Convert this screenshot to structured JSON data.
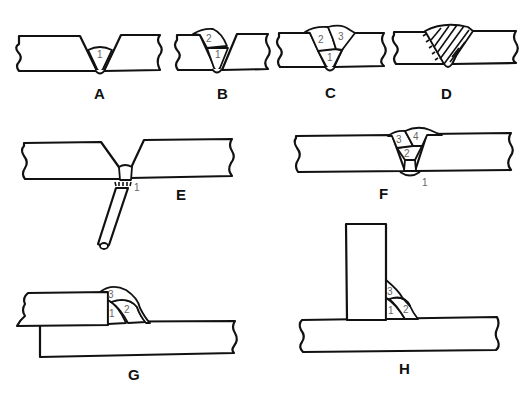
{
  "diagram": {
    "colors": {
      "line": "#111111",
      "pass_number": "#666666",
      "background": "#ffffff"
    },
    "figures": [
      {
        "id": "A",
        "label": "A",
        "joint": "single-V butt",
        "passes": [
          "1"
        ]
      },
      {
        "id": "B",
        "label": "B",
        "joint": "single-V butt",
        "passes": [
          "1",
          "2"
        ]
      },
      {
        "id": "C",
        "label": "C",
        "joint": "single-V butt",
        "passes": [
          "1",
          "2",
          "3"
        ]
      },
      {
        "id": "D",
        "label": "D",
        "joint": "single-V butt (hatched fill)",
        "passes": []
      },
      {
        "id": "E",
        "label": "E",
        "joint": "single-V butt with electrode (root pass)",
        "passes": [
          "1"
        ]
      },
      {
        "id": "F",
        "label": "F",
        "joint": "single-V butt",
        "passes": [
          "1",
          "2",
          "3",
          "4"
        ]
      },
      {
        "id": "G",
        "label": "G",
        "joint": "lap joint fillet",
        "passes": [
          "1",
          "2",
          "3"
        ]
      },
      {
        "id": "H",
        "label": "H",
        "joint": "T-joint fillet",
        "passes": [
          "1",
          "2",
          "3"
        ]
      }
    ]
  }
}
